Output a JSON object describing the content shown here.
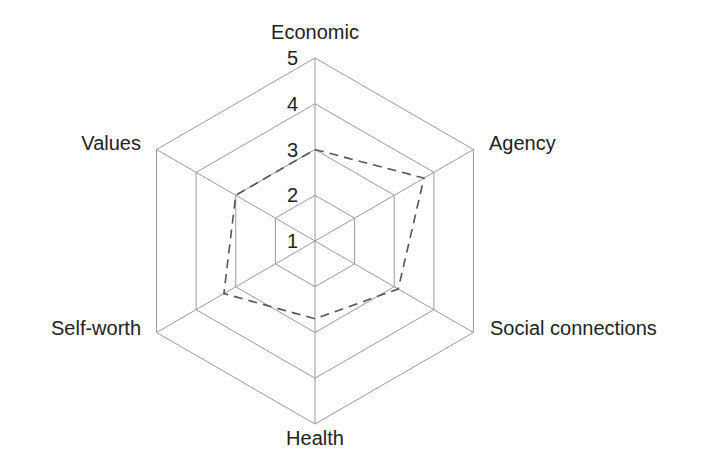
{
  "chart_data": {
    "type": "radar",
    "title": "",
    "axes": [
      "Economic",
      "Agency",
      "Social connections",
      "Health",
      "Self-worth",
      "Values"
    ],
    "scale_ticks": [
      "1",
      "2",
      "3",
      "4",
      "5"
    ],
    "range": [
      1,
      5
    ],
    "series": [
      {
        "name": "",
        "values": [
          3,
          3.75,
          3.1,
          2.7,
          3.3,
          3
        ],
        "style": "dashed",
        "color": "#555555"
      }
    ],
    "grid": true,
    "legend": "none"
  },
  "colors": {
    "grid": "#999999",
    "series": "#555555",
    "text": "#222222"
  }
}
